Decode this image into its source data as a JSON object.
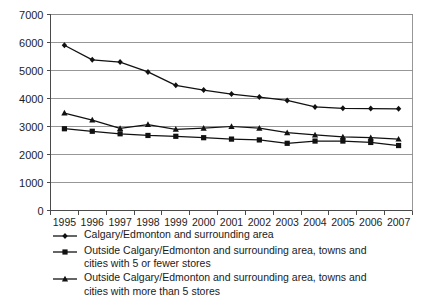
{
  "chart_data": {
    "type": "line",
    "title": "",
    "xlabel": "",
    "ylabel": "",
    "categories": [
      "1995",
      "1996",
      "1997",
      "1998",
      "1999",
      "2000",
      "2001",
      "2002",
      "2003",
      "2004",
      "2005",
      "2006",
      "2007"
    ],
    "ylim": [
      0,
      7000
    ],
    "ytick_labels": [
      "0",
      "1000",
      "2000",
      "3000",
      "4000",
      "5000",
      "6000",
      "7000"
    ],
    "ytick_values": [
      0,
      1000,
      2000,
      3000,
      4000,
      5000,
      6000,
      7000
    ],
    "grid": "horizontal",
    "legend_position": "below",
    "series": [
      {
        "name": "Calgary/Edmonton and surrounding area",
        "marker": "diamond",
        "color": "#111111",
        "values": [
          5900,
          5380,
          5300,
          4950,
          4470,
          4300,
          4160,
          4050,
          3930,
          3700,
          3650,
          3640,
          3630
        ]
      },
      {
        "name": "Outside Calgary/Edmonton and surrounding area, towns and\ncities with 5 or fewer stores",
        "marker": "square",
        "color": "#111111",
        "values": [
          2920,
          2830,
          2740,
          2680,
          2650,
          2600,
          2550,
          2520,
          2400,
          2480,
          2480,
          2430,
          2320
        ]
      },
      {
        "name": "Outside Calgary/Edmonton and surrounding area, towns and\ncities with more than 5 stores",
        "marker": "triangle",
        "color": "#111111",
        "values": [
          3480,
          3230,
          2930,
          3070,
          2900,
          2940,
          3000,
          2940,
          2780,
          2700,
          2630,
          2600,
          2550
        ]
      }
    ]
  }
}
